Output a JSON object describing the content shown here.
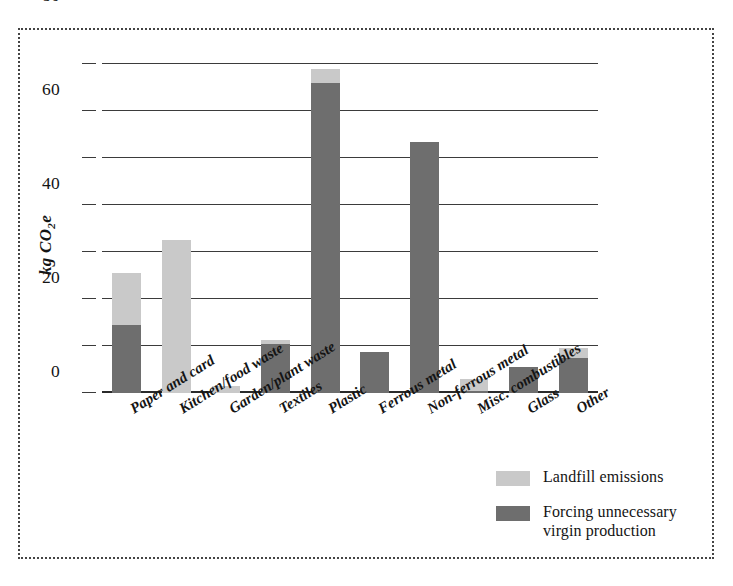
{
  "chart_data": {
    "type": "bar",
    "stacked": true,
    "title": "",
    "subtitle": "",
    "xlabel": "",
    "ylabel": "kg CO2e",
    "ylabel_html": "kg CO<sub>2</sub>e",
    "ylim": [
      0,
      140
    ],
    "yticks": [
      0,
      20,
      40,
      60,
      80,
      100,
      120,
      140
    ],
    "ytick_labels": [
      "0",
      "20",
      "40",
      "60",
      "80",
      "100",
      "120",
      "140"
    ],
    "grid": true,
    "grid_axis": "y",
    "legend_position": "bottom-right",
    "categories": [
      "Paper and card",
      "Kitchen/food waste",
      "Garden/plant waste",
      "Textiles",
      "Plastic",
      "Ferrous metal",
      "Non-ferrous metal",
      "Misc. combustibles",
      "Glass",
      "Other"
    ],
    "series": [
      {
        "name": "Forcing unnecessary virgin production",
        "color": "#6e6e6e",
        "values": [
          29,
          0,
          0,
          21,
          132,
          17.5,
          107,
          1,
          11,
          15
        ]
      },
      {
        "name": "Landfill emissions",
        "color": "#c9c9c9",
        "values": [
          22,
          65,
          3,
          1.5,
          6,
          0,
          0,
          5,
          0,
          4
        ]
      }
    ],
    "totals": [
      51,
      65,
      3,
      22.5,
      138,
      17.5,
      107,
      6,
      11,
      19
    ]
  },
  "legend": {
    "items": [
      {
        "label": "Landfill emissions",
        "color": "#c9c9c9",
        "swatch_name": "legend-swatch-landfill"
      },
      {
        "label": "Forcing unnecessary\nvirgin production",
        "color": "#6e6e6e",
        "swatch_name": "legend-swatch-virgin"
      }
    ]
  },
  "colors": {
    "landfill": "#c9c9c9",
    "virgin_production": "#6e6e6e",
    "axis": "#3b3b3b",
    "frame": "#444444",
    "text": "#141414",
    "background": "#ffffff"
  }
}
